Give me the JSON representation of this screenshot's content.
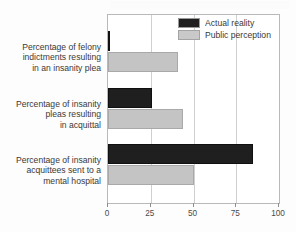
{
  "chart_data": {
    "type": "bar",
    "orientation": "horizontal",
    "title": "",
    "subtitle": "",
    "xlabel": "",
    "ylabel": "",
    "xlim": [
      0,
      100
    ],
    "xticks": [
      0,
      25,
      50,
      75,
      100
    ],
    "xtick_labels": [
      "0",
      "25",
      "50",
      "75",
      "100"
    ],
    "grid": true,
    "grid_axis": "x",
    "legend_position": "top-right",
    "categories": [
      "Percentage of felony indictments resulting in an insanity plea",
      "Percentage of insanity pleas resulting in acquittal",
      "Percentage of insanity acquittees sent to a mental hospital"
    ],
    "category_lines": [
      [
        "Percentage of felony",
        "indictments resulting",
        "in an insanity plea"
      ],
      [
        "Percentage of insanity",
        "pleas resulting",
        "in acquittal"
      ],
      [
        "Percentage of insanity",
        "acquittees sent to a",
        "mental hospital"
      ]
    ],
    "series": [
      {
        "name": "Actual reality",
        "color": "#1f1f1f",
        "values": [
          1,
          26,
          85
        ]
      },
      {
        "name": "Public perception",
        "color": "#c4c4c4",
        "values": [
          41,
          44,
          50
        ]
      }
    ]
  }
}
